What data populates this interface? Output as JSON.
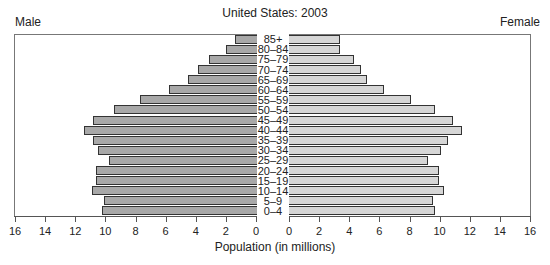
{
  "chart_data": {
    "type": "bar",
    "orientation": "horizontal-population-pyramid",
    "title": "United States: 2003",
    "xlabel": "Population (in millions)",
    "ylabel": "",
    "left_label": "Male",
    "right_label": "Female",
    "categories": [
      "0–4",
      "5–9",
      "10–14",
      "15–19",
      "20–24",
      "25–29",
      "30–34",
      "35–39",
      "40–44",
      "45–49",
      "50–54",
      "55–59",
      "60–64",
      "65–69",
      "70–74",
      "75–79",
      "80–84",
      "85+"
    ],
    "series": [
      {
        "name": "Male",
        "color": "#a8a8a8",
        "values": [
          10.2,
          10.1,
          10.9,
          10.6,
          10.6,
          9.75,
          10.5,
          10.8,
          11.4,
          10.8,
          9.4,
          7.7,
          5.8,
          4.5,
          3.85,
          3.1,
          2.0,
          1.4
        ]
      },
      {
        "name": "Female",
        "color": "#d6d6d6",
        "values": [
          9.7,
          9.55,
          10.3,
          9.95,
          9.95,
          9.2,
          10.1,
          10.55,
          11.5,
          10.9,
          9.7,
          8.1,
          6.3,
          5.2,
          4.8,
          4.3,
          3.4,
          3.4
        ]
      }
    ],
    "xlim": [
      0,
      16
    ],
    "male_ticks": [
      "16",
      "14",
      "12",
      "10",
      "8",
      "6",
      "4",
      "2",
      "0"
    ],
    "female_ticks": [
      "0",
      "2",
      "4",
      "6",
      "8",
      "10",
      "12",
      "14",
      "16"
    ],
    "grid": false,
    "legend": "side labels (Male left, Female right)"
  },
  "caption": "1 Population pyramids. These charts show numbers of ... in ... and the population ..."
}
